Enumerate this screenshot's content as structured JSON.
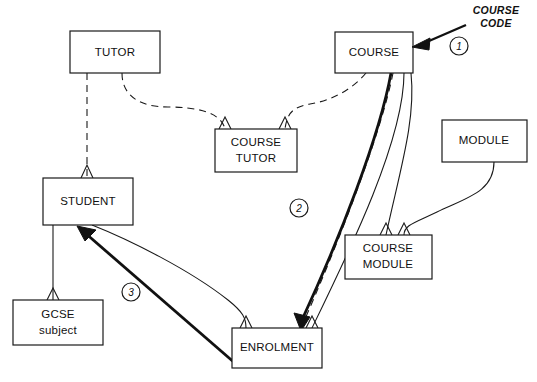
{
  "diagram": {
    "canvas": {
      "width": 537,
      "height": 382,
      "background": "#ffffff"
    },
    "stroke_color": "#1a1a1a",
    "entities": [
      {
        "id": "tutor",
        "label": "TUTOR",
        "label_line1": "TUTOR",
        "label_line2": "",
        "x": 70,
        "y": 31,
        "w": 90,
        "h": 42
      },
      {
        "id": "course",
        "label": "COURSE",
        "label_line1": "COURSE",
        "label_line2": "",
        "x": 335,
        "y": 32,
        "w": 78,
        "h": 41
      },
      {
        "id": "course-tutor",
        "label": "COURSE TUTOR",
        "label_line1": "COURSE",
        "label_line2": "TUTOR",
        "x": 215,
        "y": 129,
        "w": 82,
        "h": 43
      },
      {
        "id": "module",
        "label": "MODULE",
        "label_line1": "MODULE",
        "label_line2": "",
        "x": 442,
        "y": 120,
        "w": 85,
        "h": 42
      },
      {
        "id": "student",
        "label": "STUDENT",
        "label_line1": "STUDENT",
        "label_line2": "",
        "x": 43,
        "y": 178,
        "w": 90,
        "h": 47
      },
      {
        "id": "course-module",
        "label": "COURSE MODULE",
        "label_line1": "COURSE",
        "label_line2": "MODULE",
        "x": 345,
        "y": 235,
        "w": 87,
        "h": 44
      },
      {
        "id": "gcse-subject",
        "label": "GCSE subject",
        "label_line1": "GCSE",
        "label_line2": "subject",
        "x": 13,
        "y": 300,
        "w": 90,
        "h": 45
      },
      {
        "id": "enrolment",
        "label": "ENROLMENT",
        "label_line1": "ENROLMENT",
        "label_line2": "",
        "x": 232,
        "y": 328,
        "w": 90,
        "h": 40
      }
    ],
    "relationships": [
      {
        "id": "tutor-student",
        "from": "tutor",
        "to": "student",
        "style": "dashed"
      },
      {
        "id": "tutor-course-tutor",
        "from": "tutor",
        "to": "course-tutor",
        "style": "dashed"
      },
      {
        "id": "course-course-tutor",
        "from": "course",
        "to": "course-tutor",
        "style": "dashed"
      },
      {
        "id": "course-enrolment",
        "from": "course",
        "to": "enrolment",
        "style": "dashed"
      },
      {
        "id": "course-enrolment-2",
        "from": "course",
        "to": "enrolment",
        "style": "solid"
      },
      {
        "id": "course-course-module",
        "from": "course",
        "to": "course-module",
        "style": "solid"
      },
      {
        "id": "module-course-module",
        "from": "module",
        "to": "course-module",
        "style": "solid"
      },
      {
        "id": "student-enrolment",
        "from": "student",
        "to": "enrolment",
        "style": "solid"
      },
      {
        "id": "gcse-student",
        "from": "gcse-subject",
        "to": "student",
        "style": "solid"
      }
    ],
    "callout": {
      "text_line1": "COURSE",
      "text_line2": "CODE",
      "points_to": "course"
    },
    "markers": [
      {
        "id": "marker-1",
        "label": "1",
        "cx": 459,
        "cy": 46,
        "r": 9
      },
      {
        "id": "marker-2",
        "label": "2",
        "cx": 299,
        "cy": 208,
        "r": 9
      },
      {
        "id": "marker-3",
        "label": "3",
        "cx": 131,
        "cy": 292,
        "r": 9
      }
    ],
    "highlight_arrows": [
      {
        "id": "highlight-course-to-enrolment",
        "from": "course",
        "to": "enrolment"
      },
      {
        "id": "highlight-enrolment-to-student",
        "from": "enrolment",
        "to": "student"
      }
    ]
  }
}
